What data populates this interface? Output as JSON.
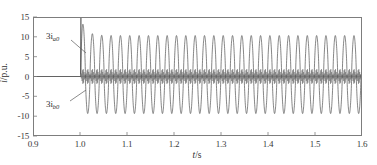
{
  "chart_data": {
    "type": "line",
    "title": "",
    "xlabel": "t/s",
    "ylabel": "i/p.u.",
    "xlim": [
      0.9,
      1.6
    ],
    "ylim": [
      -15,
      15
    ],
    "xticks": [
      "0.9",
      "1.0",
      "1.1",
      "1.2",
      "1.3",
      "1.4",
      "1.5",
      "1.6"
    ],
    "xtick_values": [
      0.9,
      1.0,
      1.1,
      1.2,
      1.3,
      1.4,
      1.5,
      1.6
    ],
    "yticks": [
      "15",
      "10",
      "5",
      "0",
      "-5",
      "-10",
      "-15"
    ],
    "ytick_values": [
      15,
      10,
      5,
      0,
      -5,
      -10,
      -15
    ],
    "grid": false,
    "legend_position": "none",
    "fault_time": 1.0,
    "series": [
      {
        "name": "3i_a0",
        "label": "3i",
        "subscript": "a0",
        "color": "#555555",
        "description": "Zero-sequence current, large 50 Hz oscillation after fault",
        "pre_fault_value": 0,
        "inrush_peak": 15.0,
        "steady_peak_positive": 10.5,
        "steady_peak_negative": -9.5,
        "frequency_hz": 50,
        "waveform": "flat-zero until t=1.0, spike to 15.0, then sustained sinusoid 10.5/-9.5"
      },
      {
        "name": "3i_b0",
        "label": "3i",
        "subscript": "b0",
        "color": "#666666",
        "description": "Zero-sequence current, small high-frequency ripple near zero after fault",
        "pre_fault_value": 0,
        "steady_peak_positive": 1.6,
        "steady_peak_negative": -1.6,
        "frequency_hz": 600,
        "waveform": "flat-zero until t=1.0, then low-amplitude high-frequency ripple about zero"
      }
    ],
    "annotations": [
      {
        "name": "3i_a0",
        "label": "3i",
        "subscript": "a0",
        "points_to_time": 1.0,
        "points_to_value": 5.0
      },
      {
        "name": "3i_b0",
        "label": "3i",
        "subscript": "b0",
        "points_to_time": 1.0,
        "points_to_value": -2.0
      }
    ]
  }
}
